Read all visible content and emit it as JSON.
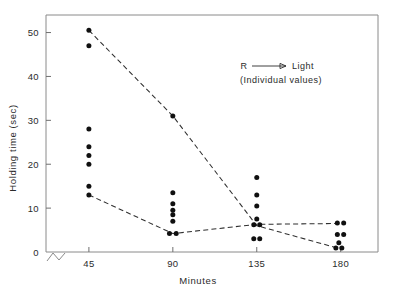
{
  "chart_data": {
    "type": "scatter",
    "title": "",
    "xlabel": "Minutes",
    "ylabel": "Holding time (sec)",
    "xlim": [
      22,
      200
    ],
    "ylim": [
      0,
      54
    ],
    "grid": false,
    "x_ticks": [
      45,
      90,
      135,
      180
    ],
    "x_tick_labels": [
      "45",
      "90",
      "135",
      "180"
    ],
    "y_ticks": [
      0,
      10,
      20,
      30,
      40,
      50
    ],
    "y_tick_labels": [
      "0",
      "10",
      "20",
      "30",
      "40",
      "50"
    ],
    "axis_break": true,
    "legend": {
      "position": "upper right",
      "line1_left": "R",
      "line1_right": "Light",
      "line1_arrow": "arrow-right",
      "line2": "(Individual values)"
    },
    "series": [
      {
        "name": "Upper group individual values",
        "marker": "filled-circle",
        "line_style": "dashed",
        "categories": [
          45,
          90,
          135,
          180
        ],
        "values": [
          [
            50.5,
            47.0
          ],
          [
            31.0
          ],
          [
            6.0
          ],
          [
            1.0,
            1.0,
            0.5
          ]
        ],
        "mean_line_x": [
          45,
          90,
          135,
          180
        ],
        "mean_line_y": [
          50.5,
          31.0,
          6.0,
          0.7
        ]
      },
      {
        "name": "Lower group individual values",
        "marker": "filled-circle",
        "line_style": "dashed",
        "categories": [
          45,
          90,
          135,
          180
        ],
        "values": [
          [
            28.0,
            24.0,
            22.0,
            20.0,
            15.0,
            13.0
          ],
          [
            13.5,
            11.0,
            9.5,
            8.5,
            7.0,
            4.2,
            4.2
          ],
          [
            17.0,
            13.0,
            10.5,
            7.5,
            6.0,
            6.0,
            3.0,
            3.0
          ],
          [
            6.5,
            6.5,
            4.0,
            4.0,
            2.0,
            1.5,
            0.8
          ]
        ],
        "mean_line_x": [
          45,
          90,
          135,
          180
        ],
        "mean_line_y": [
          13.0,
          4.2,
          6.3,
          6.5
        ]
      }
    ],
    "all_points": [
      {
        "x": 45,
        "y": 50.5
      },
      {
        "x": 45,
        "y": 47.0
      },
      {
        "x": 45,
        "y": 28.0
      },
      {
        "x": 45,
        "y": 24.0
      },
      {
        "x": 45,
        "y": 22.0
      },
      {
        "x": 45,
        "y": 20.0
      },
      {
        "x": 45,
        "y": 15.0
      },
      {
        "x": 45,
        "y": 13.0
      },
      {
        "x": 90,
        "y": 31.0
      },
      {
        "x": 90,
        "y": 13.5
      },
      {
        "x": 90,
        "y": 11.0
      },
      {
        "x": 90,
        "y": 9.5
      },
      {
        "x": 90,
        "y": 8.5
      },
      {
        "x": 90,
        "y": 7.0
      },
      {
        "x": 88.2,
        "y": 4.2
      },
      {
        "x": 91.8,
        "y": 4.2
      },
      {
        "x": 135,
        "y": 17.0
      },
      {
        "x": 135,
        "y": 13.0
      },
      {
        "x": 135,
        "y": 10.5
      },
      {
        "x": 135,
        "y": 7.5
      },
      {
        "x": 133.4,
        "y": 6.2
      },
      {
        "x": 136.6,
        "y": 6.2
      },
      {
        "x": 133.4,
        "y": 3.0
      },
      {
        "x": 136.6,
        "y": 3.0
      },
      {
        "x": 178.2,
        "y": 6.6
      },
      {
        "x": 181.6,
        "y": 6.6
      },
      {
        "x": 178.2,
        "y": 4.0
      },
      {
        "x": 181.6,
        "y": 4.0
      },
      {
        "x": 179.0,
        "y": 2.1
      },
      {
        "x": 177.4,
        "y": 0.9
      },
      {
        "x": 180.6,
        "y": 0.9
      }
    ]
  }
}
